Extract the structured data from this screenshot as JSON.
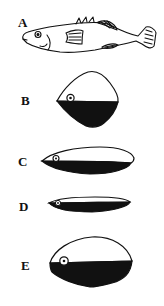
{
  "figure": {
    "panels": [
      {
        "id": "A",
        "label": "A",
        "description": "fish lateral view"
      },
      {
        "id": "B",
        "label": "B",
        "description": "cross-section, deep rhomboid body"
      },
      {
        "id": "C",
        "label": "C",
        "description": "cross-section, moderately compressed body"
      },
      {
        "id": "D",
        "label": "D",
        "description": "cross-section, strongly flattened body"
      },
      {
        "id": "E",
        "label": "E",
        "description": "cross-section, oval body"
      }
    ],
    "colors": {
      "outline": "#111111",
      "fill_dark": "#111111",
      "fill_light": "#ffffff"
    }
  }
}
